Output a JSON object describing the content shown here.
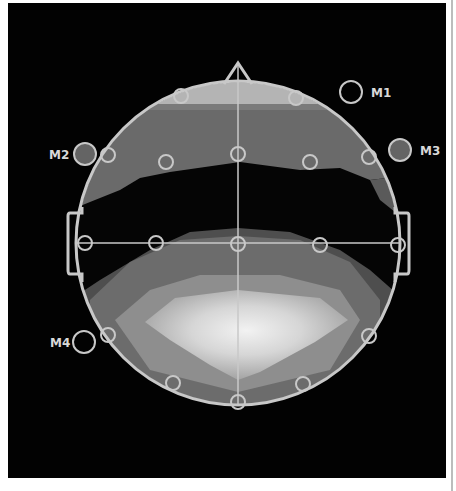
{
  "diagram": {
    "type": "eeg-topographic-map",
    "colors": {
      "background": "#020202",
      "outline": "#c8c8c8",
      "band_frontal_light": "#b4b4b4",
      "band_frontal_mid": "#6a6a6a",
      "band_dark": "#050505",
      "band_posterior_outer": "#5e5e5e",
      "band_posterior_mid": "#8c8c8c",
      "band_posterior_peak": "#e2e2e2",
      "reference_fill": "#646464"
    },
    "head": {
      "cx": 238,
      "cy": 243,
      "r": 162
    },
    "references": [
      {
        "id": "M1",
        "label": "M1",
        "filled": false
      },
      {
        "id": "M2",
        "label": "M2",
        "filled": true
      },
      {
        "id": "M3",
        "label": "M3",
        "filled": true
      },
      {
        "id": "M4",
        "label": "M4",
        "filled": false
      }
    ],
    "electrode_count": 17
  }
}
